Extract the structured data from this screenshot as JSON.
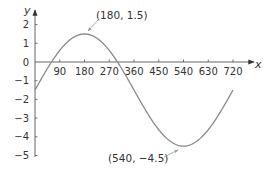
{
  "chart_data": {
    "type": "line",
    "title": "",
    "xlabel": "x",
    "ylabel": "y",
    "xlim": [
      0,
      720
    ],
    "ylim": [
      -5,
      2
    ],
    "grid": false,
    "x_ticks": [
      90,
      180,
      270,
      360,
      450,
      540,
      630,
      720
    ],
    "x_tick_labels": [
      "90",
      "180",
      "270",
      "360",
      "450",
      "540",
      "630",
      "720"
    ],
    "y_ticks": [
      2,
      1,
      0,
      -1,
      -2,
      -3,
      -4,
      -5
    ],
    "y_tick_labels": [
      "2",
      "1",
      "0",
      "−1",
      "−2",
      "−3",
      "−4",
      "−5"
    ],
    "series": [
      {
        "name": "y = 3cos((x−180)/2) − 1.5",
        "function": "y = -1.5 + 3*cos(((x-180)/2) degrees)",
        "x": [
          0,
          90,
          180,
          270,
          360,
          450,
          540,
          630,
          720
        ],
        "values": [
          -1.5,
          0.62,
          1.5,
          0.62,
          -1.5,
          -3.62,
          -4.5,
          -3.62,
          -1.5
        ],
        "color": "#888888"
      }
    ],
    "annotations": [
      {
        "text": "(180, 1.5)",
        "x": 180,
        "y": 1.5
      },
      {
        "text": "(540, −4.5)",
        "x": 540,
        "y": -4.5
      }
    ]
  }
}
